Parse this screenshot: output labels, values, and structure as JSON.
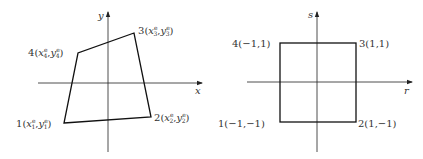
{
  "colors": {
    "line": "#222222",
    "text": "#333333",
    "background": "#ffffff"
  },
  "left_diagram": {
    "title": "physical element (x-y)",
    "axes": {
      "horizontal": "x",
      "vertical": "y"
    },
    "nodes": [
      {
        "id": "1",
        "label_num": "1",
        "xsym": "x",
        "ysym": "y",
        "sub": "1",
        "sup": "e"
      },
      {
        "id": "2",
        "label_num": "2",
        "xsym": "x",
        "ysym": "y",
        "sub": "2",
        "sup": "e"
      },
      {
        "id": "3",
        "label_num": "3",
        "xsym": "x",
        "ysym": "y",
        "sub": "3",
        "sup": "e"
      },
      {
        "id": "4",
        "label_num": "4",
        "xsym": "x",
        "ysym": "y",
        "sub": "4",
        "sup": "e"
      }
    ]
  },
  "right_diagram": {
    "title": "natural element (r-s)",
    "axes": {
      "horizontal": "r",
      "vertical": "s"
    },
    "nodes": [
      {
        "id": "1",
        "label": "1(−1,−1)"
      },
      {
        "id": "2",
        "label": "2(1,−1)"
      },
      {
        "id": "3",
        "label": "3(1,1)"
      },
      {
        "id": "4",
        "label": "4(−1,1)"
      }
    ]
  },
  "punct": {
    "open": "(",
    "comma": ",",
    "close": ")"
  }
}
